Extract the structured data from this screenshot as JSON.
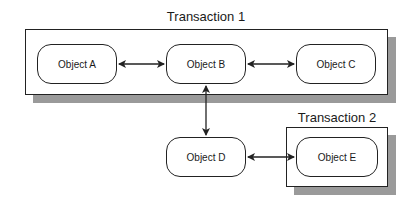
{
  "transactions": [
    {
      "id": "t1",
      "label": "Transaction 1"
    },
    {
      "id": "t2",
      "label": "Transaction 2"
    }
  ],
  "objects": [
    {
      "id": "A",
      "label": "Object A",
      "transaction": "Transaction 1"
    },
    {
      "id": "B",
      "label": "Object B",
      "transaction": "Transaction 1"
    },
    {
      "id": "C",
      "label": "Object C",
      "transaction": "Transaction 1"
    },
    {
      "id": "D",
      "label": "Object D",
      "transaction": null
    },
    {
      "id": "E",
      "label": "Object E",
      "transaction": "Transaction 2"
    }
  ],
  "connections": [
    {
      "from": "Object A",
      "to": "Object B",
      "type": "bidirectional"
    },
    {
      "from": "Object B",
      "to": "Object C",
      "type": "bidirectional"
    },
    {
      "from": "Object B",
      "to": "Object D",
      "type": "bidirectional"
    },
    {
      "from": "Object D",
      "to": "Object E",
      "type": "bidirectional"
    }
  ],
  "colors": {
    "line": "#222222",
    "shadow": "#9a9a9a",
    "fill": "#ffffff"
  }
}
